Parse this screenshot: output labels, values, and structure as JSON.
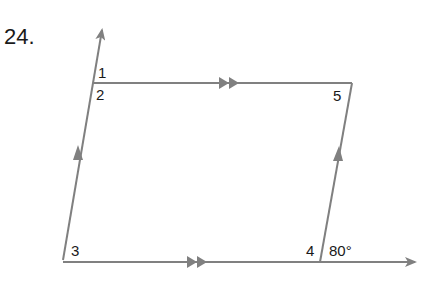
{
  "problem": {
    "number": "24."
  },
  "diagram": {
    "type": "parallelogram with extended sides",
    "line_color": "#808080",
    "vertices": {
      "top_left": [
        93,
        83
      ],
      "top_right": [
        352,
        83
      ],
      "bottom_left": [
        63,
        260
      ],
      "bottom_right": [
        320,
        262
      ]
    },
    "angle_labels": [
      {
        "id": "1",
        "text": "1"
      },
      {
        "id": "2",
        "text": "2"
      },
      {
        "id": "3",
        "text": "3"
      },
      {
        "id": "4",
        "text": "4"
      },
      {
        "id": "5",
        "text": "5"
      },
      {
        "id": "given",
        "text": "80°"
      }
    ],
    "parallel_marks": {
      "top_bottom": "double arrow",
      "left_right": "single arrow"
    }
  }
}
